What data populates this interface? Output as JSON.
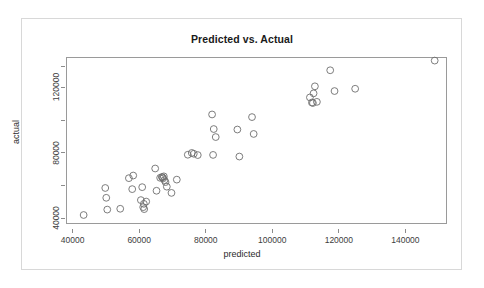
{
  "chart_data": {
    "type": "scatter",
    "title": "Predicted vs. Actual",
    "xlabel": "predicted",
    "ylabel": "actual",
    "xlim": [
      38000,
      152500
    ],
    "ylim": [
      36500,
      138500
    ],
    "grid": false,
    "legend": null,
    "marker": {
      "shape": "open-circle",
      "color": "#6e6e6e",
      "size": 3.4
    },
    "xticks": [
      40000,
      60000,
      80000,
      100000,
      120000,
      140000
    ],
    "xticklabels": [
      "40000",
      "60000",
      "80000",
      "100000",
      "120000",
      "140000"
    ],
    "yticks": [
      40000,
      60000,
      80000,
      100000,
      120000
    ],
    "yticklabels": [
      "40000",
      "",
      "80000",
      "",
      "120000"
    ],
    "yticklabels_shown": [
      "40000",
      "80000",
      "120000"
    ],
    "n_points": 52,
    "x": [
      43300,
      49800,
      50100,
      50400,
      54300,
      56900,
      57900,
      58200,
      60500,
      60900,
      61200,
      61400,
      61500,
      62100,
      64800,
      65200,
      66300,
      66800,
      67000,
      67200,
      67400,
      67600,
      67900,
      68300,
      69700,
      71300,
      74600,
      75800,
      76400,
      77600,
      81900,
      82200,
      82400,
      83000,
      89500,
      90100,
      93900,
      94400,
      111300,
      111900,
      112200,
      112400,
      112800,
      113400,
      117400,
      118700,
      124900,
      148800
    ],
    "y": [
      42000,
      58500,
      52500,
      45300,
      45800,
      64500,
      57800,
      66100,
      51100,
      59000,
      46800,
      48800,
      45600,
      50200,
      70400,
      56800,
      64700,
      65200,
      65000,
      64400,
      65600,
      63300,
      62100,
      59300,
      55500,
      63600,
      78800,
      79900,
      79400,
      78600,
      103400,
      78700,
      94500,
      89600,
      94200,
      77700,
      101800,
      91500,
      113800,
      110700,
      110400,
      116300,
      120600,
      111100,
      130400,
      117700,
      119100,
      136300
    ]
  }
}
